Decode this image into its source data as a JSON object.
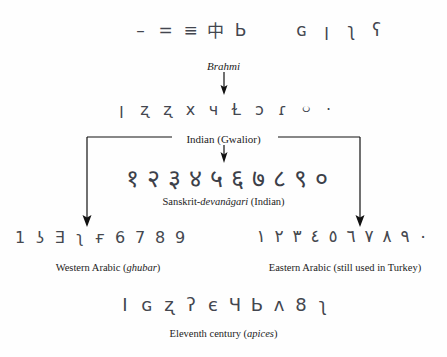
{
  "diagram": {
    "background_color": "#fefefe",
    "ink_color": "#111111",
    "glyph_color": "#43464f"
  },
  "rows": {
    "brahmi_early": {
      "name": "Early Brahmi strokes",
      "glyphs": [
        "–",
        "=",
        "≡",
        "中",
        "Ь",
        "",
        "ɢ",
        "ן",
        "ʅ",
        "ʕ"
      ]
    },
    "brahmi": {
      "name": "Brahmi numerals",
      "glyphs": [
        "ן",
        "ʐ",
        "ʐ",
        "х",
        "ч",
        "Ɫ",
        "ɔ",
        "ɾ",
        "০",
        "·"
      ]
    },
    "gwalior": {
      "name": "Sanskrit Devanagari (Gwalior) numerals",
      "glyphs": [
        "१",
        "२",
        "३",
        "४",
        "५",
        "६",
        "७",
        "८",
        "९",
        "०"
      ]
    },
    "western_arabic": {
      "name": "Western Arabic ghubar numerals",
      "glyphs": [
        "1",
        "ʖ",
        "Ǝ",
        "ʅ",
        "ғ",
        "6",
        "7",
        "8",
        "9"
      ]
    },
    "eastern_arabic": {
      "name": "Eastern Arabic numerals",
      "glyphs": [
        "١",
        "٢",
        "٣",
        "٤",
        "٥",
        "٦",
        "٧",
        "٨",
        "٩",
        "٠"
      ]
    },
    "apices": {
      "name": "Eleventh century apices",
      "glyphs": [
        "I",
        "ɢ",
        "ʐ",
        "ʔ",
        "є",
        "Ч",
        "Ь",
        "ʌ",
        "8",
        "ʅ"
      ]
    }
  },
  "labels": {
    "brahmi": "Brahmi",
    "gwalior": "Indian (Gwalior)"
  },
  "captions": {
    "devanagari_prefix": "Sanskrit-",
    "devanagari_italic": "devanâgari",
    "devanagari_suffix": " (Indian)",
    "western_prefix": "Western Arabic (",
    "western_italic": "ghubar",
    "western_suffix": ")",
    "eastern": "Eastern Arabic (still used in Turkey)",
    "apices_prefix": "Eleventh century (",
    "apices_italic": "apices",
    "apices_suffix": ")"
  }
}
